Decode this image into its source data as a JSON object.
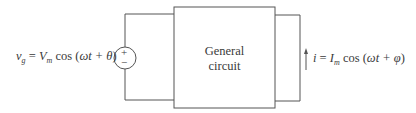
{
  "diagram": {
    "type": "circuit",
    "source": {
      "label_var": "v",
      "label_sub": "g",
      "label_eq": " = ",
      "label_amp": "V",
      "label_amp_sub": "m",
      "label_fn": " cos (",
      "label_arg": "ωt + θ",
      "label_close": ")",
      "plus": "+",
      "minus": "−"
    },
    "box": {
      "line1": "General",
      "line2": "circuit"
    },
    "current": {
      "label_var": "i",
      "label_eq": " = ",
      "label_amp": "I",
      "label_amp_sub": "m",
      "label_fn": " cos (",
      "label_arg": "ωt + φ",
      "label_close": ")"
    },
    "colors": {
      "line": "#555555",
      "text": "#3a3a3a"
    }
  }
}
